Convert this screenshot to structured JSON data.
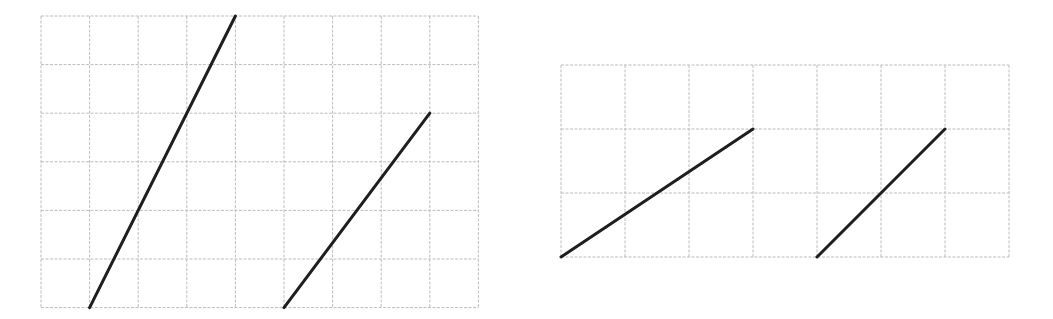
{
  "colors": {
    "background": "#ffffff",
    "grid": "#bdbdbd",
    "segment": "#1e1e1e"
  },
  "grids": [
    {
      "id": "left-grid",
      "origin": [
        41,
        16
      ],
      "cell": 48.6,
      "cols": 9,
      "rows": 6,
      "segments": [
        {
          "id": "segment-1",
          "from": [
            1,
            6
          ],
          "to": [
            4,
            0
          ],
          "note": "run 3, rise 6"
        },
        {
          "id": "segment-2",
          "from": [
            5,
            6
          ],
          "to": [
            8,
            2
          ],
          "note": "run 3, rise 4"
        }
      ]
    },
    {
      "id": "right-grid",
      "origin": [
        561,
        65
      ],
      "cell": 64,
      "cols": 7,
      "rows": 3,
      "segments": [
        {
          "id": "segment-3",
          "from": [
            0,
            3
          ],
          "to": [
            3,
            1
          ],
          "note": "run 3, rise 2"
        },
        {
          "id": "segment-4",
          "from": [
            4,
            3
          ],
          "to": [
            6,
            1
          ],
          "note": "run 2, rise 2"
        }
      ]
    }
  ]
}
